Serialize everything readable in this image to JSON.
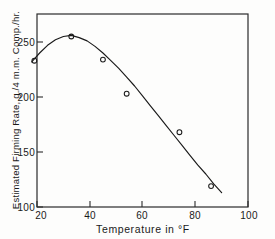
{
  "chart_data": {
    "type": "scatter",
    "title": "",
    "xlabel": "Temperature in °F",
    "ylabel": "Estimated Firming Rate, g./4 m.m. Comp./hr.",
    "xlim": [
      20,
      100
    ],
    "ylim": [
      100,
      265
    ],
    "xticks": [
      20,
      40,
      60,
      80,
      100
    ],
    "yticks": [
      100,
      150,
      200,
      250
    ],
    "xtick_labels": [
      "20",
      "40",
      "60",
      "80",
      "100"
    ],
    "ytick_labels": [
      "100",
      "150",
      "200",
      "250"
    ],
    "grid": false,
    "legend": false,
    "marker": "open-circle",
    "points": [
      {
        "x": 19,
        "y": 233
      },
      {
        "x": 33,
        "y": 255
      },
      {
        "x": 45,
        "y": 234
      },
      {
        "x": 54,
        "y": 203
      },
      {
        "x": 74,
        "y": 168
      },
      {
        "x": 86,
        "y": 119
      }
    ],
    "fit_curve": {
      "name": "fitted curve",
      "x": [
        18,
        21,
        24,
        27,
        30,
        33,
        36,
        39,
        42,
        45,
        48,
        51,
        54,
        57,
        60,
        63,
        66,
        69,
        72,
        75,
        78,
        81,
        84,
        87,
        90
      ],
      "y": [
        232,
        240,
        247,
        252,
        255,
        256,
        254,
        251,
        246,
        240,
        233,
        226,
        218,
        210,
        201,
        192,
        183,
        174,
        165,
        156,
        147,
        138,
        130,
        121,
        113
      ]
    },
    "series": [
      {
        "name": "Estimated Firming Rate",
        "x": [
          19,
          33,
          45,
          54,
          74,
          86
        ],
        "values": [
          233,
          255,
          234,
          203,
          168,
          119
        ]
      }
    ]
  },
  "colors": {
    "line": "#1a1a1a",
    "axis": "#2b2b2b",
    "marker": "#1a1a1a",
    "background": "#fdfdfc"
  }
}
